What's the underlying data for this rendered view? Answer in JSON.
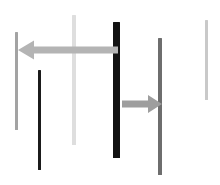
{
  "scene": {
    "name": "abstract-bars-arrows",
    "width": 220,
    "height": 185,
    "background": "#ffffff"
  },
  "chart_data": {
    "type": "bar",
    "title": "",
    "subtitle": "",
    "xlabel": "",
    "ylabel": "",
    "grid": false,
    "legend": null,
    "orientation": "vertical-segments",
    "xlim": [
      0,
      220
    ],
    "ylim": [
      0,
      185
    ],
    "categories": [
      "bar-1",
      "bar-2",
      "bar-3",
      "bar-4",
      "bar-5",
      "bar-6"
    ],
    "values": [
      98,
      100,
      130,
      136,
      137,
      80
    ],
    "series": [
      {
        "name": "vertical-bars",
        "values": [
          98,
          100,
          130,
          136,
          137,
          80
        ]
      }
    ],
    "annotations": [
      "arrow-left",
      "arrow-right"
    ]
  },
  "bars": [
    {
      "id": "bar-1",
      "label": "light-gray-bar-left",
      "x": 15,
      "y": 32,
      "width": 3,
      "height": 98,
      "color": "#a3a3a3"
    },
    {
      "id": "bar-2",
      "label": "dark-bar-lower-left",
      "x": 38,
      "y": 70,
      "width": 3,
      "height": 100,
      "color": "#1b1b1b"
    },
    {
      "id": "bar-3",
      "label": "pale-gray-bar-center-left",
      "x": 72,
      "y": 15,
      "width": 4,
      "height": 130,
      "color": "#dedede"
    },
    {
      "id": "bar-4",
      "label": "black-thick-bar-center",
      "x": 113,
      "y": 22,
      "width": 7,
      "height": 136,
      "color": "#121212"
    },
    {
      "id": "bar-5",
      "label": "medium-gray-bar-right",
      "x": 158,
      "y": 38,
      "width": 4,
      "height": 137,
      "color": "#6e6e6e"
    },
    {
      "id": "bar-6",
      "label": "light-gray-bar-far-right",
      "x": 205,
      "y": 20,
      "width": 3,
      "height": 80,
      "color": "#c9c9c9"
    }
  ],
  "arrows": [
    {
      "id": "arrow-left",
      "label": "leftward-arrow",
      "direction": "left",
      "from_x": 118,
      "to_x": 18,
      "y": 50,
      "shaft_thickness": 7,
      "head_width": 16,
      "head_height": 19,
      "color": "#b4b4b4"
    },
    {
      "id": "arrow-right",
      "label": "rightward-arrow",
      "direction": "right",
      "from_x": 122,
      "to_x": 162,
      "y": 104,
      "shaft_thickness": 7,
      "head_width": 14,
      "head_height": 18,
      "color": "#9e9e9e"
    }
  ]
}
